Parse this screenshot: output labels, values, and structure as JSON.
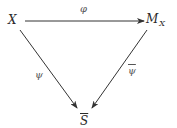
{
  "diagram": {
    "type": "commutative-triangle",
    "nodes": {
      "X": {
        "label": "X"
      },
      "M": {
        "label": "M",
        "subscript": "X"
      },
      "S": {
        "label": "S",
        "overline": true
      }
    },
    "edges": {
      "phi": {
        "from": "X",
        "to": "M_X",
        "label": "φ"
      },
      "psi": {
        "from": "X",
        "to": "S̄",
        "label": "ψ"
      },
      "psibar": {
        "from": "M_X",
        "to": "S̄",
        "label": "ψ",
        "overline": true
      }
    },
    "colors": {
      "line": "#333333",
      "text": "#2a2a2a",
      "edge_label": "#555555",
      "background": "#ffffff"
    }
  }
}
